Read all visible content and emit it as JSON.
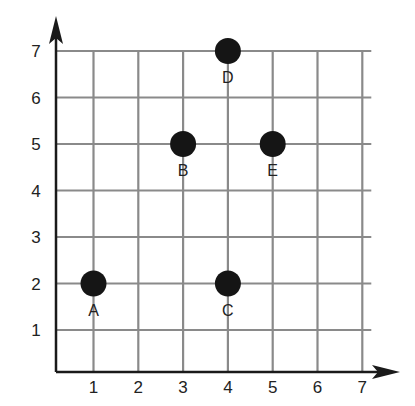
{
  "chart_data": {
    "type": "scatter",
    "title": "",
    "xlabel": "",
    "ylabel": "",
    "xlim": [
      0,
      7
    ],
    "ylim": [
      0,
      7
    ],
    "grid": true,
    "x_ticks": [
      "1",
      "2",
      "3",
      "4",
      "5",
      "6",
      "7"
    ],
    "y_ticks": [
      "1",
      "2",
      "3",
      "4",
      "5",
      "6",
      "7"
    ],
    "points": [
      {
        "label": "A",
        "x": 1,
        "y": 2
      },
      {
        "label": "B",
        "x": 3,
        "y": 5
      },
      {
        "label": "C",
        "x": 4,
        "y": 2
      },
      {
        "label": "D",
        "x": 4,
        "y": 7
      },
      {
        "label": "E",
        "x": 5,
        "y": 5
      }
    ],
    "colors": {
      "grid": "#8a8a8a",
      "axis": "#1a1a1a",
      "point": "#151515"
    }
  }
}
